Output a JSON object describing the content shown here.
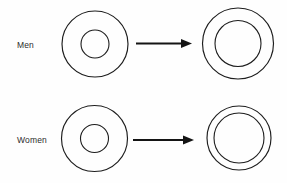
{
  "figure": {
    "type": "concentric-ring-diagram",
    "background_color": "#fefefe",
    "stroke_color": "#1d1d1d",
    "text_color": "#2b2b2b",
    "width": 287,
    "height": 183,
    "rows": [
      {
        "label": "Men",
        "label_x": 17,
        "label_y": 46,
        "before": {
          "name": "men-before-ring",
          "cx": 95,
          "cy": 44,
          "outer_r": 33,
          "inner_r": 14
        },
        "after": {
          "name": "men-after-ring",
          "cx": 238,
          "cy": 43.5,
          "outer_r": 35.5,
          "inner_r": 23
        },
        "arrow": {
          "name": "men-arrow",
          "x1": 136,
          "x2": 192,
          "y": 43.5,
          "head_length": 11,
          "head_width": 9
        }
      },
      {
        "label": "Women",
        "label_x": 17,
        "label_y": 141,
        "before": {
          "name": "women-before-ring",
          "cx": 94.5,
          "cy": 138.5,
          "outer_r": 33,
          "inner_r": 14
        },
        "after": {
          "name": "women-after-ring",
          "cx": 239,
          "cy": 138,
          "outer_r": 32,
          "inner_r": 25
        },
        "arrow": {
          "name": "women-arrow",
          "x1": 133,
          "x2": 194,
          "y": 140,
          "head_length": 11,
          "head_width": 9
        }
      }
    ]
  }
}
